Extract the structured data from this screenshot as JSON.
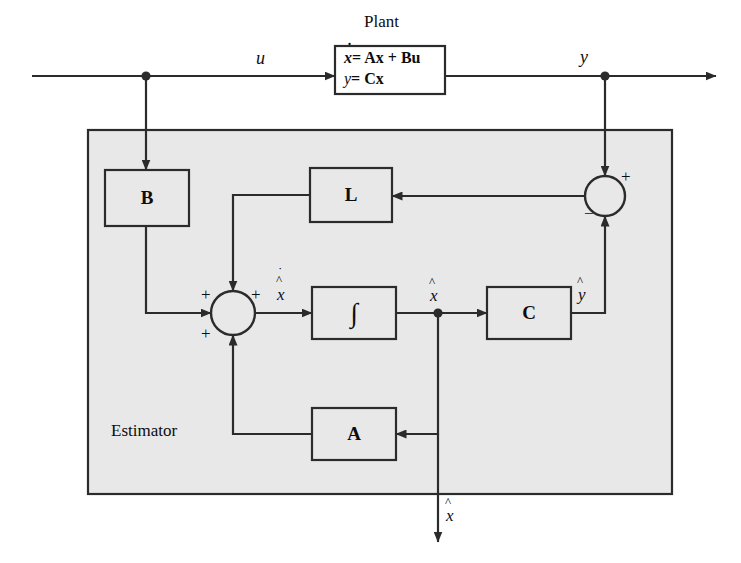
{
  "diagram": {
    "title_labels": {
      "plant": "Plant",
      "estimator": "Estimator"
    },
    "plant_equations": {
      "line1_lhs": "x",
      "line1_rhs": "= Ax + Bu",
      "line2_lhs": "y",
      "line2_rhs": "= Cx",
      "line1_full": "ẋ = Ax + Bu",
      "line2_full": "y = Cx"
    },
    "blocks": [
      {
        "id": "plant",
        "label": "ẋ = Ax + Bu ; y = Cx",
        "x": 335,
        "y": 46,
        "w": 110,
        "h": 48
      },
      {
        "id": "gain-b",
        "label": "B",
        "x": 105,
        "y": 170,
        "w": 84,
        "h": 56
      },
      {
        "id": "gain-l",
        "label": "L",
        "x": 310,
        "y": 168,
        "w": 82,
        "h": 54
      },
      {
        "id": "integrator",
        "label": "∫",
        "x": 312,
        "y": 287,
        "w": 84,
        "h": 52
      },
      {
        "id": "gain-c",
        "label": "C",
        "x": 487,
        "y": 287,
        "w": 84,
        "h": 52
      },
      {
        "id": "gain-a",
        "label": "A",
        "x": 312,
        "y": 408,
        "w": 84,
        "h": 52
      }
    ],
    "signal_labels": {
      "u": "u",
      "y": "y",
      "x_dot_hat": "x",
      "x_hat": "x",
      "y_hat": "y",
      "x_hat_output": "x"
    },
    "summers": [
      {
        "id": "estimator-summer",
        "cx": 233,
        "cy": 313,
        "r": 22,
        "signs": [
          {
            "text": "+",
            "pos": "top-left"
          },
          {
            "text": "+",
            "pos": "top-right"
          },
          {
            "text": "+",
            "pos": "bottom-left"
          }
        ]
      },
      {
        "id": "error-summer",
        "cx": 605,
        "cy": 196,
        "r": 20,
        "signs": [
          {
            "text": "+",
            "pos": "top-right"
          },
          {
            "text": "−",
            "pos": "bottom-left"
          }
        ]
      }
    ],
    "estimator_region": {
      "x": 88,
      "y": 130,
      "w": 584,
      "h": 364,
      "fill": "#e8e8e8",
      "stroke": "#2b2b2b"
    },
    "colors": {
      "line": "#2b2b2b",
      "text": "#0d0d0d",
      "shaded_region": "#e8e8e8",
      "block_fill": "#ffffff",
      "background": "#ffffff"
    }
  }
}
